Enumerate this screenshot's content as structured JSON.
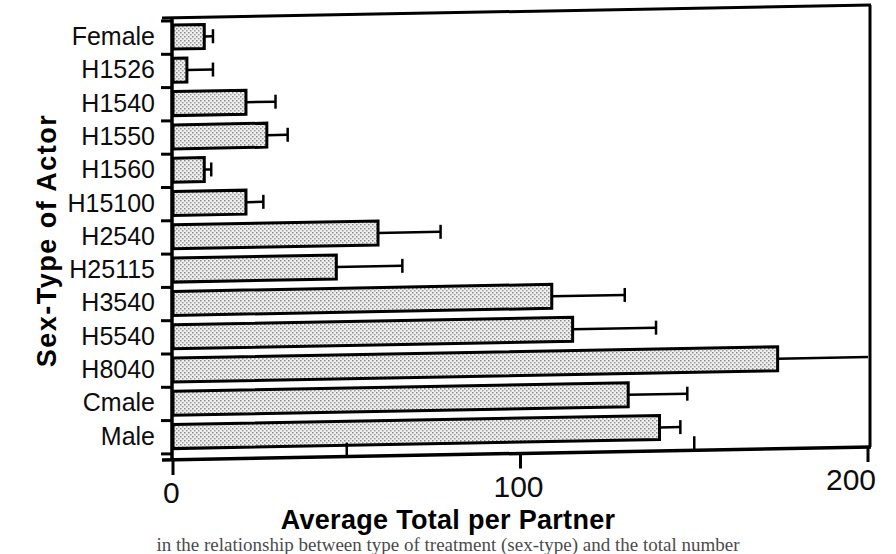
{
  "chart_data": {
    "type": "bar",
    "orientation": "horizontal",
    "title": "",
    "xlabel": "Average Total per Partner",
    "ylabel": "Sex-Type of Actor",
    "xlim": [
      0,
      200
    ],
    "xticks": [
      0,
      100,
      200
    ],
    "xtick_labels": [
      "0",
      "100",
      "200"
    ],
    "minor_xticks": [
      50,
      150
    ],
    "grid": false,
    "legend": null,
    "categories": [
      "Female",
      "H1526",
      "H1540",
      "H1550",
      "H1560",
      "H15100",
      "H2540",
      "H25115",
      "H3540",
      "H5540",
      "H8040",
      "Cmale",
      "Male"
    ],
    "values": [
      9,
      4,
      21,
      27,
      9,
      21,
      59,
      47,
      109,
      115,
      174,
      131,
      140
    ],
    "errors": [
      2.5,
      7.5,
      8.5,
      6.0,
      2.0,
      5.0,
      18.0,
      19.0,
      21.0,
      24.0,
      26.0,
      17.0,
      6.0
    ],
    "error_upper": [
      11.5,
      11.5,
      29.5,
      33.0,
      11.0,
      26.0,
      77.0,
      66.0,
      130.0,
      139.0,
      200.0,
      148.0,
      146.0
    ],
    "bar_fill": "#e3e3e3",
    "bar_edge": "#000000",
    "fill_pattern": "stipple"
  },
  "axes": {
    "x_axis_label": "Average Total per Partner",
    "y_axis_label": "Sex-Type of Actor",
    "tick_0": "0",
    "tick_100": "100",
    "tick_200": "200"
  },
  "caption": {
    "text": "in the relationship between type of treatment (sex-type) and the total number"
  },
  "colors": {
    "ink": "#000000",
    "bar_fill": "#e3e3e3",
    "background": "#ffffff"
  }
}
